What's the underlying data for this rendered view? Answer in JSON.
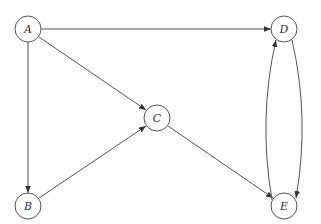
{
  "diagram": {
    "type": "directed-graph",
    "nodes": [
      {
        "id": "A",
        "label": "A",
        "x": 28,
        "y": 29
      },
      {
        "id": "B",
        "label": "B",
        "x": 28,
        "y": 206
      },
      {
        "id": "C",
        "label": "C",
        "x": 157,
        "y": 118
      },
      {
        "id": "D",
        "label": "D",
        "x": 284,
        "y": 29
      },
      {
        "id": "E",
        "label": "E",
        "x": 284,
        "y": 206
      }
    ],
    "edges": [
      {
        "from": "A",
        "to": "D"
      },
      {
        "from": "A",
        "to": "C"
      },
      {
        "from": "A",
        "to": "B"
      },
      {
        "from": "B",
        "to": "C"
      },
      {
        "from": "C",
        "to": "E"
      },
      {
        "from": "D",
        "to": "E"
      },
      {
        "from": "E",
        "to": "D"
      }
    ],
    "colors": {
      "stroke": "#555555",
      "background": "#ffffff"
    }
  }
}
